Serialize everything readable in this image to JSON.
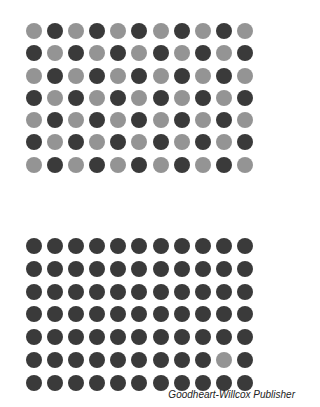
{
  "colors": {
    "dark": "#3a3a3a",
    "light": "#949494"
  },
  "top_grid": {
    "rows": 7,
    "cols": 11,
    "pattern": [
      "LDLDLDLDLDL",
      "DLDLDLDLDLD",
      "LDLDLDLDLDL",
      "DLDLDLDLDLD",
      "LDLDLDLDLDL",
      "DLDLDLDLDLD",
      "LDLDLDLDLDL"
    ]
  },
  "bottom_grid": {
    "rows": 7,
    "cols": 11,
    "pattern": [
      "DDDDDDDDDDD",
      "DDDDDDDDDDD",
      "DDDDDDDDDDD",
      "DDDDDDDDDDD",
      "DDDDDDDDDDD",
      "DDDDDDDDDLD",
      "DDDDDDDDDDD"
    ]
  },
  "caption": "Goodheart-Willcox Publisher"
}
